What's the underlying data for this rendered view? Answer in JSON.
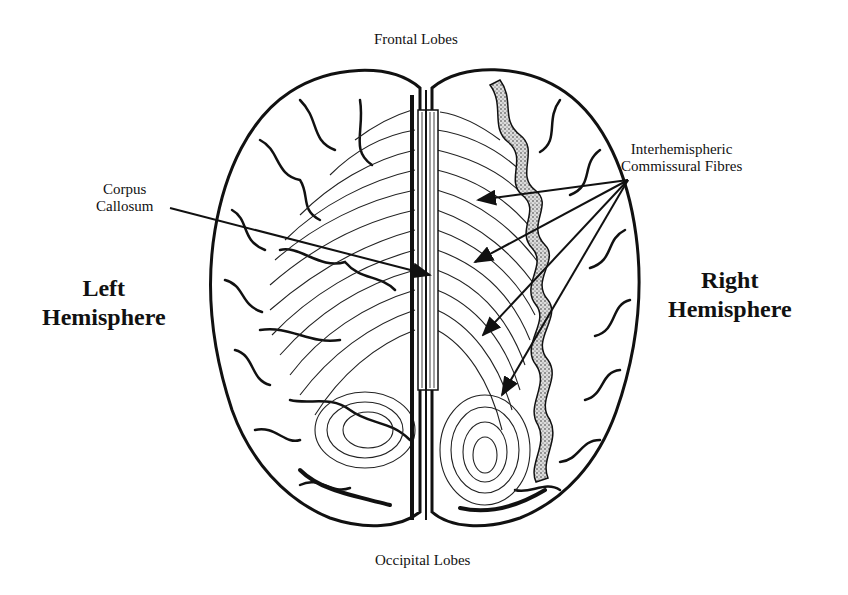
{
  "diagram": {
    "type": "anatomical-illustration",
    "labels": {
      "frontal": "Frontal Lobes",
      "occipital": "Occipital Lobes",
      "corpus_callosum_line1": "Corpus",
      "corpus_callosum_line2": "Callosum",
      "interhemispheric_line1": "Interhemispheric",
      "interhemispheric_line2": "Commissural Fibres",
      "left_line1": "Left",
      "left_line2": "Hemisphere",
      "right_line1": "Right",
      "right_line2": "Hemisphere"
    },
    "arrows": {
      "corpus_callosum": {
        "from": [
          170,
          208
        ],
        "to": [
          430,
          275
        ]
      },
      "commissural_fibres": [
        {
          "from": [
            628,
            180
          ],
          "to": [
            478,
            200
          ]
        },
        {
          "from": [
            628,
            180
          ],
          "to": [
            475,
            262
          ]
        },
        {
          "from": [
            628,
            180
          ],
          "to": [
            483,
            335
          ]
        },
        {
          "from": [
            628,
            180
          ],
          "to": [
            502,
            395
          ]
        }
      ]
    },
    "colors": {
      "ink": "#111111",
      "background": "#ffffff",
      "stipple": "#555555"
    }
  }
}
